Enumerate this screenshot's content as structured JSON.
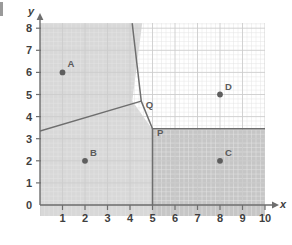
{
  "figure": {
    "type": "voronoi-diagram",
    "axes": {
      "x_label": "x",
      "y_label": "y",
      "x_ticks": [
        "0",
        "1",
        "2",
        "3",
        "4",
        "5",
        "6",
        "7",
        "8",
        "9",
        "10"
      ],
      "y_ticks": [
        "0",
        "1",
        "2",
        "3",
        "4",
        "5",
        "6",
        "7",
        "8"
      ],
      "origin_label": "0",
      "xlim": [
        0,
        10
      ],
      "ylim": [
        0,
        8.2
      ],
      "grid": "minor grid, 5 subdivisions per unit"
    },
    "sites": [
      {
        "label": "A",
        "x": 1,
        "y": 6
      },
      {
        "label": "B",
        "x": 2,
        "y": 2
      },
      {
        "label": "C",
        "x": 8,
        "y": 2
      },
      {
        "label": "D",
        "x": 8,
        "y": 5
      }
    ],
    "vertices": [
      {
        "label": "Q",
        "x": 4.5,
        "y": 4.7
      },
      {
        "label": "P",
        "x": 5.0,
        "y": 3.45
      }
    ],
    "edges": [
      {
        "name": "A-B boundary",
        "from": [
          0,
          3.35
        ],
        "to": [
          4.5,
          4.7
        ]
      },
      {
        "name": "A-D boundary",
        "from": [
          4.5,
          4.7
        ],
        "to": [
          4.1,
          8.2
        ]
      },
      {
        "name": "B-D boundary",
        "from": [
          4.5,
          4.7
        ],
        "to": [
          5.0,
          3.45
        ]
      },
      {
        "name": "C-D boundary",
        "from": [
          5.0,
          3.45
        ],
        "to": [
          10,
          3.45
        ]
      },
      {
        "name": "B-C boundary",
        "from": [
          5.0,
          3.45
        ],
        "to": [
          5.0,
          0
        ]
      }
    ],
    "regions": [
      {
        "name": "region-A",
        "site": "A",
        "shaded": true
      },
      {
        "name": "region-B",
        "site": "B",
        "shaded": true
      },
      {
        "name": "region-C",
        "site": "C",
        "shaded": true
      },
      {
        "name": "region-D",
        "site": "D",
        "shaded": false
      }
    ],
    "colors": {
      "shade_light": "#d6d6d6",
      "shade_dark": "#c2c2c2",
      "unshaded": "#ffffff",
      "edge": "#6e6e6e",
      "axis": "#6e6e6e",
      "grid_minor": "#e2e2e2",
      "grid_major": "#cfcfcf",
      "point": "#5e5e5e",
      "text": "#3f3f3f"
    }
  }
}
